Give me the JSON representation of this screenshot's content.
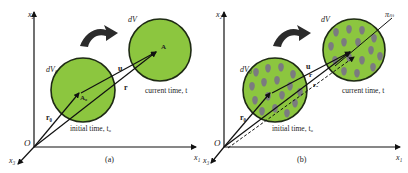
{
  "colors": {
    "green_fill": "#8cc63f",
    "circle_stroke": "#1e2a14",
    "blob_fill": "#7b7b80",
    "line": "#111111",
    "curved_arrow": "#2b2b2b"
  },
  "panels": [
    {
      "id": "a",
      "caption": "(a)",
      "axes": {
        "x1": "x₁",
        "x2": "x₂",
        "x3": "x₃",
        "origin": "O"
      },
      "labels": {
        "dV0": "dV₀",
        "dV": "dV",
        "u": "u",
        "r": "r",
        "r0": "r₀",
        "A0": "A₀",
        "A": "A",
        "initial": "initial time, t₀",
        "current": "current time, t"
      }
    },
    {
      "id": "b",
      "caption": "(b)",
      "axes": {
        "x1": "x₁",
        "x2": "x₂",
        "x3": "x₃",
        "origin": "O"
      },
      "labels": {
        "dV0": "dV₀",
        "dV": "dV",
        "u": "u",
        "r": "r",
        "r0": "r₀",
        "ra": "rₐ",
        "pi": "πₘ",
        "initial": "initial time, t₀",
        "current": "current time, t"
      }
    }
  ]
}
